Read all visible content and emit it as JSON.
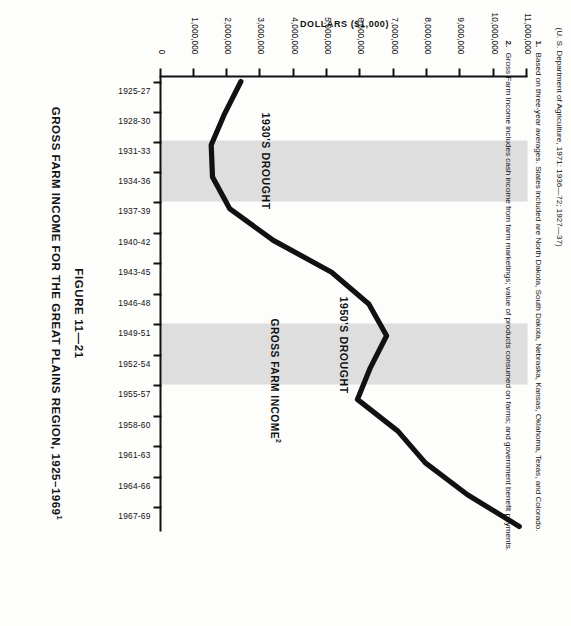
{
  "figure": {
    "number": "FIGURE 11—21",
    "title": "GROSS FARM INCOME FOR THE GREAT PLAINS REGION, 1925–1969",
    "title_superscript": "1",
    "source": "(U. S. Department of Agriculture, 1971: 1936—72; 1927—37)",
    "footnotes": [
      {
        "num": "1.",
        "text": "Based on three-year averages.  States included are North Dakota, South Dakota, Nebraska, Kansas, Oklahoma, Texas, and Colorado."
      },
      {
        "num": "2.",
        "text": "Gross Farm Income includes cash income from farm marketings; value of products consumed on farms; and government benefit payments."
      }
    ]
  },
  "colors": {
    "line": "#111111",
    "band": "#dedede",
    "axis": "#111111",
    "background": "#fdfdfb"
  },
  "chart_data": {
    "type": "line",
    "title": "GROSS FARM INCOME FOR THE GREAT PLAINS REGION, 1925–1969",
    "xlabel": "",
    "ylabel": "DOLLARS ($1,000)",
    "ylim": [
      0,
      11000000
    ],
    "grid": false,
    "legend": "inline-label",
    "categories": [
      "1925-27",
      "1928-30",
      "1931-33",
      "1934-36",
      "1937-39",
      "1940-42",
      "1943-45",
      "1946-48",
      "1949-51",
      "1952-54",
      "1955-57",
      "1958-60",
      "1961-63",
      "1964-66",
      "1967-69"
    ],
    "series": [
      {
        "name": "GROSS FARM INCOME",
        "name_superscript": "2",
        "values": [
          2300000,
          1800000,
          1380000,
          1420000,
          1950000,
          3300000,
          5100000,
          6250000,
          6800000,
          6300000,
          5900000,
          7150000,
          8000000,
          9300000,
          10900000
        ]
      }
    ],
    "ytick_labels": [
      "0",
      "1,000,000",
      "2,000,000",
      "3,000,000",
      "4,000,000",
      "5,000,000",
      "6,000,000",
      "7,000,000",
      "8,000,000",
      "9,000,000",
      "10,000,000",
      "11,000,000"
    ],
    "ytick_values": [
      0,
      1000000,
      2000000,
      3000000,
      4000000,
      5000000,
      6000000,
      7000000,
      8000000,
      9000000,
      10000000,
      11000000
    ],
    "annotations": [
      {
        "label": "1930'S DROUGHT",
        "type": "shaded-band",
        "span": [
          "1931-33",
          "1934-36"
        ]
      },
      {
        "label": "1950'S DROUGHT",
        "type": "shaded-band",
        "span": [
          "1952-54",
          "1955-57"
        ]
      }
    ]
  }
}
